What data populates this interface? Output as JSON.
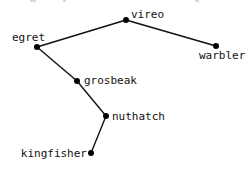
{
  "diagram": {
    "type": "tree",
    "colors": {
      "edge": "#111111",
      "node": "#000000",
      "label": "#111111",
      "background": "#ffffff"
    },
    "nodes": [
      {
        "id": "vireo",
        "label": "vireo",
        "x": 126,
        "y": 20,
        "label_x": 131,
        "label_y": 18,
        "anchor": "start"
      },
      {
        "id": "egret",
        "label": "egret",
        "x": 37,
        "y": 47,
        "label_x": 12,
        "label_y": 41,
        "anchor": "start"
      },
      {
        "id": "warbler",
        "label": "warbler",
        "x": 216,
        "y": 46,
        "label_x": 199,
        "label_y": 59,
        "anchor": "start"
      },
      {
        "id": "grosbeak",
        "label": "grosbeak",
        "x": 77,
        "y": 81,
        "label_x": 84,
        "label_y": 84,
        "anchor": "start"
      },
      {
        "id": "nuthatch",
        "label": "nuthatch",
        "x": 106,
        "y": 116,
        "label_x": 112,
        "label_y": 120,
        "anchor": "start"
      },
      {
        "id": "kingfisher",
        "label": "kingfisher",
        "x": 91,
        "y": 153,
        "label_x": 87,
        "label_y": 157,
        "anchor": "end"
      }
    ],
    "edges": [
      {
        "from": "vireo",
        "to": "egret"
      },
      {
        "from": "vireo",
        "to": "warbler"
      },
      {
        "from": "egret",
        "to": "grosbeak"
      },
      {
        "from": "grosbeak",
        "to": "nuthatch"
      },
      {
        "from": "nuthatch",
        "to": "kingfisher"
      }
    ]
  }
}
